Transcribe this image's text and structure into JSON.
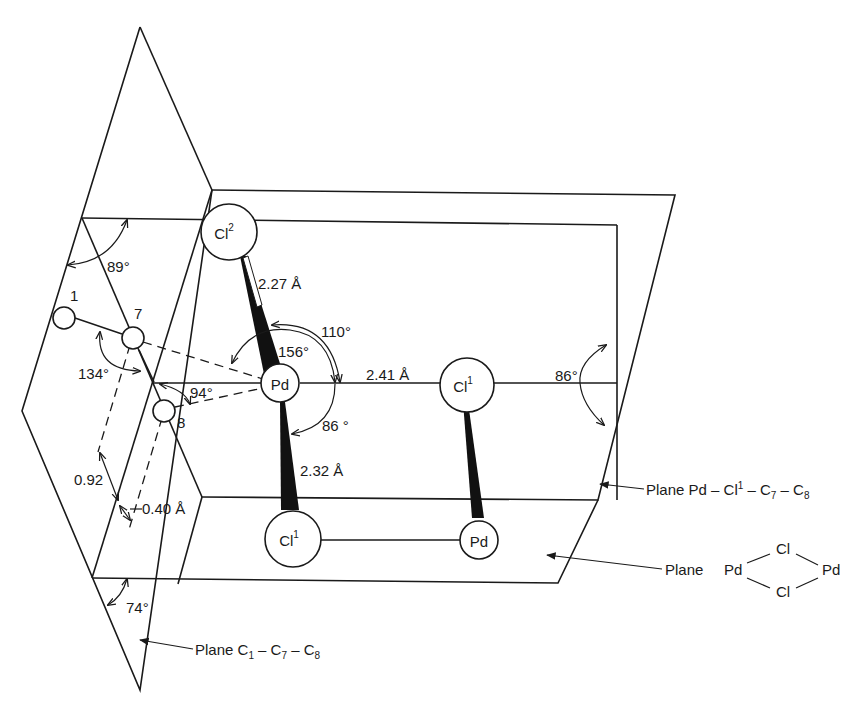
{
  "diagram": {
    "atoms": {
      "cl2_top": {
        "symbol": "Cl",
        "sup": "2"
      },
      "pd_center": {
        "symbol": "Pd"
      },
      "cl1_right": {
        "symbol": "Cl",
        "sup": "1"
      },
      "cl1_bottom": {
        "symbol": "Cl",
        "sup": "1"
      },
      "pd_bottom": {
        "symbol": "Pd"
      },
      "c1": {
        "label": "1"
      },
      "c7": {
        "label": "7"
      },
      "c8": {
        "label": "8"
      }
    },
    "bond_lengths": {
      "pd_cl2": "2.27 Å",
      "pd_cl1": "2.41 Å",
      "pd_cl1_bottom": "2.32 Å",
      "dist_092": "0.92",
      "dist_040": "0.40 Å"
    },
    "angles": {
      "a89": "89°",
      "a110": "110°",
      "a156": "156°",
      "a86_inner": "86 °",
      "a86_right": "86°",
      "a134": "134°",
      "a94": "94°",
      "a74": "74°"
    },
    "plane_labels": {
      "pd_cl1_c7_c8": {
        "prefix": "Plane Pd – Cl",
        "sup": "1",
        "mid": " – C",
        "sub1": "7",
        "dash": " – C",
        "sub2": "8"
      },
      "pd_cl_pd_cl": {
        "prefix": "Plane",
        "pd_left": "Pd",
        "cl_top": "Cl",
        "pd_right": "Pd",
        "cl_bottom": "Cl"
      },
      "c1_c7_c8": {
        "prefix": "Plane C",
        "sub1": "1",
        "dash1": " – C",
        "sub2": "7",
        "dash2": " – C",
        "sub3": "8"
      }
    }
  }
}
